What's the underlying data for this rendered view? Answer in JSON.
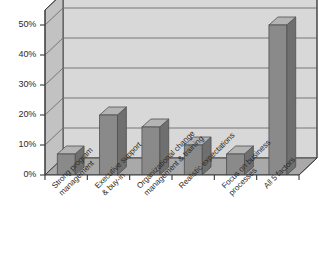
{
  "chart_data": {
    "type": "bar",
    "title": "",
    "subtitle": "",
    "xlabel": "",
    "ylabel": "",
    "ylim": [
      0,
      55
    ],
    "grid": true,
    "legend": "none",
    "style": "3d-column",
    "categories": [
      "Strong program management",
      "Executive support & buy-in",
      "Organizational change management & training",
      "Realistic expectations",
      "Focus on business processes",
      "All 5 factors"
    ],
    "category_lines": [
      [
        "Strong program",
        "management"
      ],
      [
        "Executive support",
        "& buy-in"
      ],
      [
        "Organizational change",
        "management & training"
      ],
      [
        "Realistic expectations",
        ""
      ],
      [
        "Focus on business",
        "processes"
      ],
      [
        "All 5 factors",
        ""
      ]
    ],
    "values": [
      7,
      20,
      16,
      10,
      7,
      50
    ],
    "ytick_labels": [
      "50%",
      "40%",
      "30%",
      "20%",
      "10%",
      "0%"
    ],
    "ytick_values": [
      50,
      40,
      30,
      20,
      10,
      0
    ],
    "colors": {
      "bar_front": "#8a8a8a",
      "bar_top": "#b4b4b4",
      "bar_side": "#6f6f6f",
      "wall_back": "#d8d8d8",
      "wall_side": "#c2c2c2",
      "floor": "#a9a9a9",
      "floor_side": "#bdbdbd",
      "gridline": "#6e6e6e",
      "axis": "#3a3a3a",
      "text": "#2b2b2b",
      "background": "#ffffff"
    }
  }
}
